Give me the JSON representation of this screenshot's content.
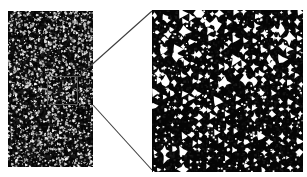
{
  "figure": {
    "background_color": "#ffffff",
    "kind": "micrograph-with-magnified-inset",
    "panels": [
      {
        "id": "overview",
        "role": "overview-micrograph",
        "x": 8,
        "y": 11,
        "width": 85,
        "height": 156,
        "matrix_color": "#050505",
        "particle_color": "#f2f2f2",
        "particle_count": 1450,
        "particle_size_px": [
          0.6,
          1.9
        ],
        "description": "low-magnification dark field showing fine bright dispersed particles"
      },
      {
        "id": "detail",
        "role": "magnified-micrograph",
        "x": 152,
        "y": 10,
        "width": 151,
        "height": 162,
        "matrix_color": "#050505",
        "particle_color": "#ffffff",
        "particle_count": 330,
        "particle_size_px": [
          2.5,
          9.0
        ],
        "description": "high-magnification view of the boxed region showing angular bright particles"
      }
    ],
    "region_of_interest": {
      "label": "selection-box",
      "x": 47,
      "y": 76,
      "width": 31,
      "height": 29,
      "stroke_color": "#5a5a5a",
      "stroke_width": 1
    },
    "connectors": {
      "stroke_color": "#3d3d3d",
      "stroke_width": 1.1,
      "lines": [
        {
          "name": "upper-connector",
          "x1": 78,
          "y1": 77,
          "x2": 152,
          "y2": 11
        },
        {
          "name": "lower-connector",
          "x1": 93,
          "y1": 105,
          "x2": 152,
          "y2": 170
        }
      ]
    }
  },
  "chart_data": {
    "type": "scatter",
    "title": "",
    "xlabel": "",
    "ylabel": "",
    "note": "Two-panel microstructure image: an overview field and a magnified detail of the outlined region.",
    "series": [
      {
        "name": "overview-particles",
        "panel": "overview",
        "count": 1450,
        "mean_diameter_px": 1.1,
        "area_fraction_pct": 9
      },
      {
        "name": "detail-particles",
        "panel": "detail",
        "count": 330,
        "mean_diameter_px": 5.2,
        "area_fraction_pct": 14
      }
    ]
  }
}
